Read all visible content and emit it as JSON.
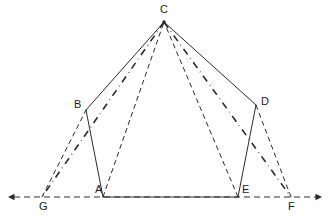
{
  "figure": {
    "kind": "geometry-diagram",
    "background_color": "#ffffff",
    "stroke_color": "#2a2a2a",
    "canvas": {
      "width": 332,
      "height": 224
    },
    "points": {
      "A": {
        "label": "A",
        "x": 103,
        "y": 197,
        "label_x": 95,
        "label_y": 184
      },
      "B": {
        "label": "B",
        "x": 86,
        "y": 110,
        "label_x": 74,
        "label_y": 99
      },
      "C": {
        "label": "C",
        "x": 164,
        "y": 22,
        "label_x": 160,
        "label_y": 4
      },
      "D": {
        "label": "D",
        "x": 256,
        "y": 105,
        "label_x": 261,
        "label_y": 96
      },
      "E": {
        "label": "E",
        "x": 238,
        "y": 197,
        "label_x": 242,
        "label_y": 184
      },
      "F": {
        "label": "F",
        "x": 291,
        "y": 197,
        "label_x": 288,
        "label_y": 201
      },
      "G": {
        "label": "G",
        "x": 42,
        "y": 197,
        "label_x": 39,
        "label_y": 201
      }
    },
    "baseline": {
      "name": "extended-baseline",
      "style": "dashed",
      "x_start": 8,
      "x_end": 322,
      "y": 197,
      "left_arrow": true,
      "right_arrow": true
    },
    "segments": [
      {
        "name": "segment-C-B",
        "from": "C",
        "to": "B",
        "style": "solid",
        "width": 1.0
      },
      {
        "name": "segment-C-D",
        "from": "C",
        "to": "D",
        "style": "solid",
        "width": 1.0
      },
      {
        "name": "segment-B-A",
        "from": "B",
        "to": "A",
        "style": "solid",
        "width": 1.0
      },
      {
        "name": "segment-D-E",
        "from": "D",
        "to": "E",
        "style": "solid",
        "width": 1.0
      },
      {
        "name": "segment-A-E",
        "from": "A",
        "to": "E",
        "style": "solid",
        "width": 1.0
      },
      {
        "name": "segment-G-B",
        "from": "G",
        "to": "B",
        "style": "dashed",
        "width": 1.0
      },
      {
        "name": "segment-A-C",
        "from": "A",
        "to": "C",
        "style": "dashed",
        "width": 1.0
      },
      {
        "name": "segment-E-C",
        "from": "E",
        "to": "C",
        "style": "dashed",
        "width": 1.0
      },
      {
        "name": "segment-D-F",
        "from": "D",
        "to": "F",
        "style": "dashed",
        "width": 1.0
      },
      {
        "name": "segment-C-G",
        "from": "C",
        "to": "G",
        "style": "dash-dot",
        "width": 1.6
      },
      {
        "name": "segment-C-F",
        "from": "C",
        "to": "F",
        "style": "dash-dot",
        "width": 1.6
      }
    ]
  }
}
